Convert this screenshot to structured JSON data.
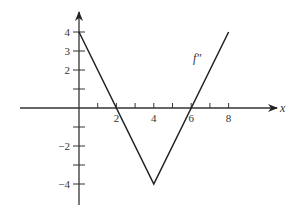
{
  "chart_data": {
    "type": "line",
    "title": "",
    "xlabel": "x",
    "ylabel": "",
    "series": [
      {
        "name": "f''",
        "label": "f″",
        "x": [
          0,
          4,
          8
        ],
        "y": [
          4,
          -4,
          4
        ]
      }
    ],
    "x_ticks": [
      1,
      2,
      3,
      4,
      5,
      6,
      7,
      8
    ],
    "x_tick_labels": [
      "2",
      "4",
      "6",
      "8"
    ],
    "x_tick_label_values": [
      2,
      4,
      6,
      8
    ],
    "y_ticks": [
      4,
      3,
      2,
      1,
      -1,
      -2,
      -3,
      -4
    ],
    "y_tick_labels": [
      "4",
      "3",
      "2",
      "−2",
      "−4"
    ],
    "y_tick_label_values": [
      4,
      3,
      2,
      -2,
      -4
    ],
    "xlim": [
      -3.2,
      10.4
    ],
    "ylim": [
      -5.1,
      5.0
    ],
    "grid": false,
    "legend": "inline label near line"
  },
  "labels": {
    "x_axis": "x",
    "curve": "f″"
  }
}
